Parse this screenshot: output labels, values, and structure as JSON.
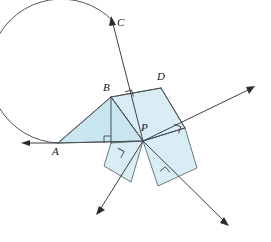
{
  "figure": {
    "kind": "geometry-diagram",
    "canvas": {
      "width": 271,
      "height": 242
    },
    "colors": {
      "background": "#ffffff",
      "polygon_fill_light": "#d9eef4",
      "polygon_fill_mid": "#c9e6f0",
      "polygon_stroke": "#5a6b74",
      "line_stroke": "#4a4a52",
      "arrow_fill": "#2b2b31",
      "label_color": "#15151a"
    },
    "points": [
      {
        "id": "A",
        "label": "A",
        "x": 58,
        "y": 143,
        "label_x": 52,
        "label_y": 147
      },
      {
        "id": "B",
        "label": "B",
        "x": 111,
        "y": 97,
        "label_x": 103,
        "label_y": 82
      },
      {
        "id": "C",
        "label": "C",
        "x": 113,
        "y": 20,
        "label_x": 117,
        "label_y": 18
      },
      {
        "id": "D",
        "label": "D",
        "x": 161,
        "y": 88,
        "label_x": 157,
        "label_y": 72
      },
      {
        "id": "P",
        "label": "P",
        "x": 143,
        "y": 141,
        "label_x": 143,
        "label_y": 123
      }
    ],
    "polygons": [
      {
        "name": "triangle-abp",
        "shade": "mid",
        "vertices": "58,143 111,97 143,141"
      },
      {
        "name": "square-below-bp",
        "shade": "light",
        "vertices": "111,97 143,141 143,141 111,143"
      },
      {
        "name": "square-bdp",
        "shade": "light",
        "vertices": "111,97 161,88 185,128 143,141"
      },
      {
        "name": "square-lower-left-of-p",
        "shade": "light",
        "vertices": "111,143 143,141 131,181 104,166"
      },
      {
        "name": "square-lower-right-of-p",
        "shade": "light",
        "vertices": "143,141 185,128 197,168 158,186"
      }
    ],
    "segments": [
      {
        "name": "seg-a-b",
        "from": "58,143",
        "to": "111,97"
      },
      {
        "name": "seg-a-p",
        "from": "58,143",
        "to": "143,141"
      },
      {
        "name": "seg-b-p",
        "from": "111,97",
        "to": "143,141"
      },
      {
        "name": "seg-b-foot",
        "from": "111,97",
        "to": "111,143"
      },
      {
        "name": "seg-b-d",
        "from": "111,97",
        "to": "161,88"
      },
      {
        "name": "seg-d-e",
        "from": "161,88",
        "to": "185,128"
      },
      {
        "name": "seg-e-p",
        "from": "185,128",
        "to": "143,141"
      }
    ],
    "right_angle_marks": [
      {
        "name": "right-angle-at-foot-of-b",
        "x": 111,
        "y": 143,
        "rotation": 0
      },
      {
        "name": "right-angle-at-bp-top",
        "x": 130,
        "y": 96,
        "rotation": -18
      },
      {
        "name": "right-angle-at-p-right",
        "x": 178,
        "y": 132,
        "rotation": 18
      },
      {
        "name": "right-angle-lower-left-of-p",
        "x": 119,
        "y": 155,
        "rotation": 28
      },
      {
        "name": "right-angle-lower-right-of-p",
        "x": 166,
        "y": 172,
        "rotation": -40
      }
    ],
    "rays": [
      {
        "name": "ray-a-left",
        "from": "58,143",
        "to": "22,143",
        "arrow": "left"
      },
      {
        "name": "ray-c-up",
        "from": "143,141",
        "to": "112,19",
        "arrow": "up"
      },
      {
        "name": "ray-p-upper-right",
        "from": "143,141",
        "to": "253,87",
        "arrow": "upper-right"
      },
      {
        "name": "ray-p-lower-left",
        "from": "143,141",
        "to": "97,214",
        "arrow": "lower-left"
      },
      {
        "name": "ray-p-lower-right",
        "from": "143,141",
        "to": "228,225",
        "arrow": "lower-right"
      }
    ],
    "arc": {
      "name": "arc-a-to-c",
      "center_x": 92,
      "center_y": 84,
      "radius": 72,
      "from": "58,143",
      "to": "113,20",
      "sweep": "counterclockwise"
    }
  }
}
